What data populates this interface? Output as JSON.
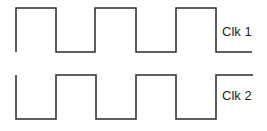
{
  "diagram": {
    "type": "timing-diagram",
    "stroke_color": "#2a2a2a",
    "signals": [
      {
        "name": "Clk 1",
        "label": "Clk 1",
        "high_y": 8,
        "low_y": 52,
        "start_x": 16,
        "points": "16,52 16,8 56,8 56,52 95,52 95,8 136,8 136,52 176,52 176,8 216,8 216,52 252,52"
      },
      {
        "name": "Clk 2",
        "label": "Clk 2",
        "high_y": 75,
        "low_y": 119,
        "start_x": 16,
        "points": "16,75 16,119 56,119 56,75 96,75 96,119 136,119 136,75 176,75 176,119 216,119 216,75 253,75"
      }
    ]
  }
}
